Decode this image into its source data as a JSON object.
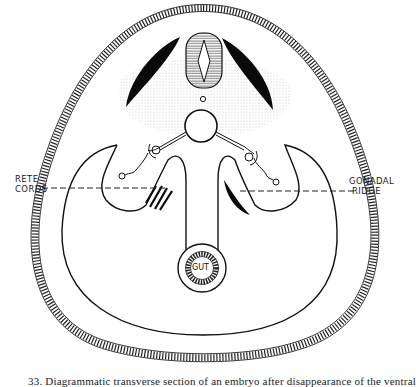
{
  "figure": {
    "labels": {
      "left_line1": "RETE",
      "left_line2": "CORDS",
      "right_line1": "GONADAL",
      "right_line2": "RIDGE",
      "gut": "GUT"
    },
    "caption": "33. Diagrammatic transverse section of an embryo after disappearance of the ventral"
  },
  "colors": {
    "ink": "#111111",
    "stipple": "#d9d9d9",
    "background": "#ffffff"
  }
}
